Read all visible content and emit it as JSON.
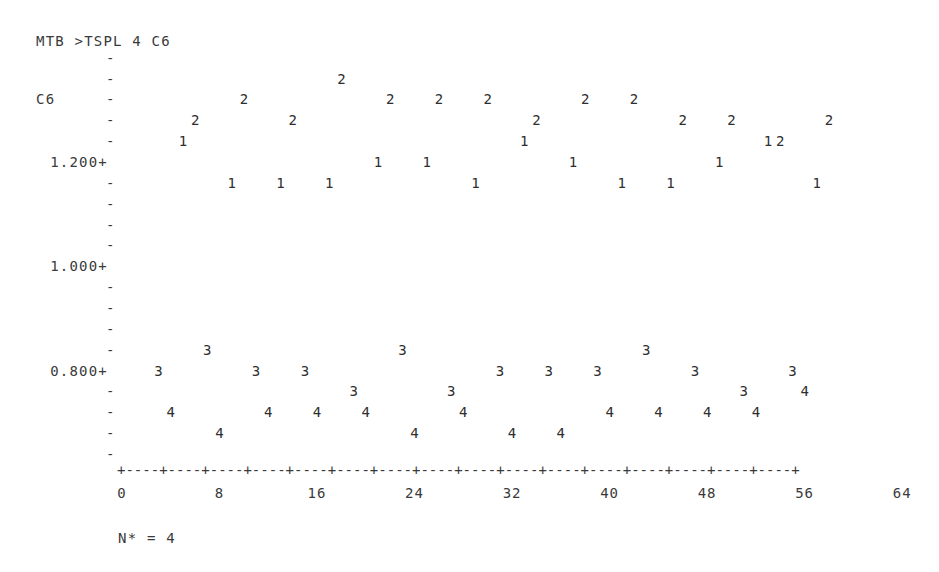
{
  "command": "MTB >TSPL 4 C6",
  "footer": "N* = 4",
  "chart_data": {
    "type": "scatter",
    "title": "MTB >TSPL 4 C6",
    "ylabel": "C6",
    "xlabel": "",
    "period": 4,
    "missing_count": 4,
    "xlim": [
      0,
      64
    ],
    "ylim": [
      0.64,
      1.4
    ],
    "x_ticks": [
      "0",
      "8",
      "16",
      "24",
      "32",
      "40",
      "48",
      "56",
      "64"
    ],
    "y_ticks": [
      "1.200+",
      "1.000+",
      "0.800+"
    ],
    "grid": false,
    "legend": "plot symbols 1-4 denote period position (season)",
    "series": [
      {
        "name": "1",
        "x": [
          5,
          9,
          13,
          17,
          21,
          25,
          29,
          33,
          37,
          41,
          45,
          49,
          53,
          57
        ],
        "values": [
          1.24,
          1.16,
          1.16,
          1.16,
          1.2,
          1.2,
          1.16,
          1.24,
          1.2,
          1.16,
          1.16,
          1.2,
          1.24,
          1.16
        ]
      },
      {
        "name": "2",
        "x": [
          6,
          10,
          14,
          18,
          22,
          26,
          30,
          34,
          38,
          42,
          46,
          50,
          54,
          58
        ],
        "values": [
          1.28,
          1.32,
          1.28,
          1.36,
          1.32,
          1.32,
          1.32,
          1.28,
          1.32,
          1.32,
          1.28,
          1.28,
          1.24,
          1.28
        ]
      },
      {
        "name": "3",
        "x": [
          3,
          7,
          11,
          15,
          19,
          23,
          27,
          31,
          35,
          39,
          43,
          47,
          51,
          55
        ],
        "values": [
          0.8,
          0.84,
          0.8,
          0.8,
          0.76,
          0.84,
          0.76,
          0.8,
          0.8,
          0.8,
          0.84,
          0.8,
          0.76,
          0.8
        ]
      },
      {
        "name": "4",
        "x": [
          4,
          8,
          12,
          16,
          20,
          24,
          28,
          32,
          36,
          40,
          44,
          48,
          52,
          56
        ],
        "values": [
          0.72,
          0.68,
          0.72,
          0.72,
          0.72,
          0.68,
          0.72,
          0.68,
          0.68,
          0.72,
          0.72,
          0.72,
          0.72,
          0.76
        ]
      }
    ]
  },
  "axis": {
    "y_name": "C6",
    "y_labels": [
      {
        "text": "1.200+",
        "row_value": 1.2
      },
      {
        "text": "1.000+",
        "row_value": 1.0
      },
      {
        "text": "0.800+",
        "row_value": 0.8
      }
    ],
    "x_rule": "+----+----+----+----+----+----+----+----+----+----+----+----+----+----+----+----+",
    "x_labels": [
      "0",
      "8",
      "16",
      "24",
      "32",
      "40",
      "48",
      "56",
      "64"
    ]
  }
}
